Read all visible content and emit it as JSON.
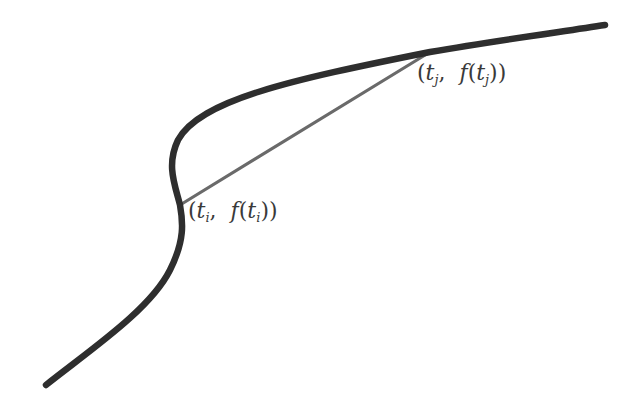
{
  "diagram": {
    "type": "curve-with-secant",
    "colors": {
      "background": "#ffffff",
      "curve": "#2e2e2e",
      "secant": "#6a6a6a",
      "label": "#3a3a3a"
    },
    "curve": {
      "description": "Thick S-shaped curve f(t) rising from bottom-left to top-right",
      "start": [
        46,
        385
      ],
      "end": [
        605,
        25
      ]
    },
    "secant": {
      "description": "Chord connecting the two labeled points on the curve",
      "from": [
        180,
        205
      ],
      "to": [
        430,
        52
      ]
    },
    "points": [
      {
        "id": "ti",
        "coords": [
          180,
          205
        ],
        "label": "(t_i, f(t_i))",
        "parts": {
          "open": "(",
          "t": "t",
          "sub": "i",
          "mid": ", ",
          "f": "f",
          "open2": "(",
          "t2": "t",
          "sub2": "i",
          "close": "))"
        }
      },
      {
        "id": "tj",
        "coords": [
          430,
          52
        ],
        "label": "(t_j, f(t_j))",
        "parts": {
          "open": "(",
          "t": "t",
          "sub": "j",
          "mid": ", ",
          "f": "f",
          "open2": "(",
          "t2": "t",
          "sub2": "j",
          "close": "))"
        }
      }
    ]
  }
}
